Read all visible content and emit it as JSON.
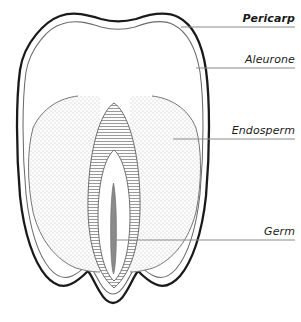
{
  "diagram": {
    "background_color": "#ffffff",
    "ink_color": "#1a1a1a",
    "leader_line_color": "#808080",
    "labels": [
      {
        "id": "pericarp",
        "text": "Pericarp",
        "style": "bold-italic",
        "leader_y": 27,
        "leader_x_start": 181,
        "leader_x_end": 295
      },
      {
        "id": "aleurone",
        "text": "Aleurone",
        "style": "italic",
        "leader_y": 68,
        "leader_x_start": 196,
        "leader_x_end": 295
      },
      {
        "id": "endosperm",
        "text": "Endosperm",
        "style": "italic",
        "leader_y": 139,
        "leader_x_start": 173,
        "leader_x_end": 295
      },
      {
        "id": "germ",
        "text": "Germ",
        "style": "italic",
        "leader_y": 240,
        "leader_x_start": 113,
        "leader_x_end": 295
      }
    ],
    "parts": {
      "pericarp": {
        "name": "Pericarp",
        "description": "outer seed coat, thick dark outline",
        "fill": "#ffffff",
        "stroke": "#1a1a1a",
        "stroke_width": 2.2
      },
      "aleurone": {
        "name": "Aleurone",
        "description": "thin inner layer just beneath the pericarp",
        "fill": "#ffffff",
        "stroke": "#555555",
        "stroke_width": 1
      },
      "endosperm": {
        "name": "Endosperm",
        "description": "stippled starchy storage tissue, left and right lobes",
        "fill": "stipple-dots",
        "stroke": "#666666",
        "stroke_width": 0.9
      },
      "germ": {
        "name": "Germ",
        "description": "central pointed oval with horizontal hatching, inner white oval and embryonic axis",
        "fill": "horizontal-hatch",
        "stroke": "#666666",
        "stroke_width": 0.9
      }
    }
  }
}
